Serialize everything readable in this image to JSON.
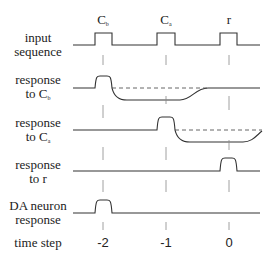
{
  "title_markers": [
    {
      "text": "C",
      "sub": "b"
    },
    {
      "text": "C",
      "sub": "a"
    },
    {
      "text": "r",
      "sub": ""
    }
  ],
  "rows": [
    {
      "line1": "input",
      "line2": "sequence",
      "sub": ""
    },
    {
      "line1": "response",
      "line2": "to C",
      "sub": "b"
    },
    {
      "line1": "response",
      "line2": "to C",
      "sub": "a"
    },
    {
      "line1": "response",
      "line2": "to r",
      "sub": ""
    },
    {
      "line1": "DA neuron",
      "line2": "response",
      "sub": ""
    },
    {
      "line1": "time step",
      "line2": "",
      "sub": ""
    }
  ],
  "time_steps": [
    "-2",
    "-1",
    "0"
  ],
  "colors": {
    "line": "#333333",
    "dashed": "#555555",
    "guide": "#888888"
  }
}
